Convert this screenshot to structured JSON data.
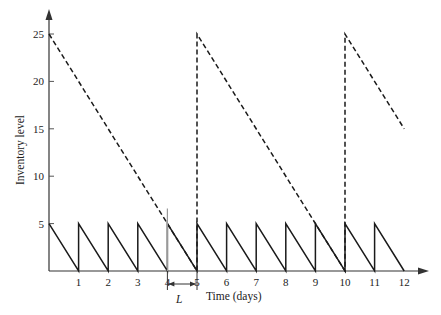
{
  "chart_data": {
    "type": "line",
    "title": "",
    "xlabel": "Time (days)",
    "ylabel": "Inventory level",
    "xlim": [
      0,
      12
    ],
    "ylim": [
      0,
      25
    ],
    "x_ticks": [
      1,
      2,
      3,
      4,
      5,
      6,
      7,
      8,
      9,
      10,
      11,
      12
    ],
    "y_ticks": [
      5,
      10,
      15,
      20,
      25
    ],
    "grid": false,
    "legend": null,
    "series": [
      {
        "name": "Inventory position",
        "style": "dashed",
        "points": [
          [
            0,
            25
          ],
          [
            4,
            5
          ],
          [
            5,
            0
          ],
          [
            5,
            25
          ],
          [
            9,
            5
          ],
          [
            10,
            0
          ],
          [
            10,
            25
          ],
          [
            12,
            15
          ]
        ]
      },
      {
        "name": "On-hand inventory",
        "style": "solid",
        "points": [
          [
            0,
            5
          ],
          [
            1,
            0
          ],
          [
            1,
            5
          ],
          [
            2,
            0
          ],
          [
            2,
            5
          ],
          [
            3,
            0
          ],
          [
            3,
            5
          ],
          [
            4,
            0
          ],
          [
            4,
            5
          ],
          [
            5,
            0
          ],
          [
            5,
            5
          ],
          [
            6,
            0
          ],
          [
            6,
            5
          ],
          [
            7,
            0
          ],
          [
            7,
            5
          ],
          [
            8,
            0
          ],
          [
            8,
            5
          ],
          [
            9,
            0
          ],
          [
            9,
            5
          ],
          [
            10,
            0
          ],
          [
            10,
            5
          ],
          [
            11,
            0
          ],
          [
            11,
            5
          ],
          [
            12,
            0
          ]
        ]
      }
    ],
    "annotations": [
      {
        "text": "L",
        "meaning": "lead time",
        "from_x": 4,
        "to_x": 5
      },
      {
        "type": "vertical-marker",
        "x": 4,
        "y_top": 6.6
      }
    ]
  },
  "labels": {
    "xlabel": "Time (days)",
    "ylabel": "Inventory level",
    "lead_time": "L"
  }
}
